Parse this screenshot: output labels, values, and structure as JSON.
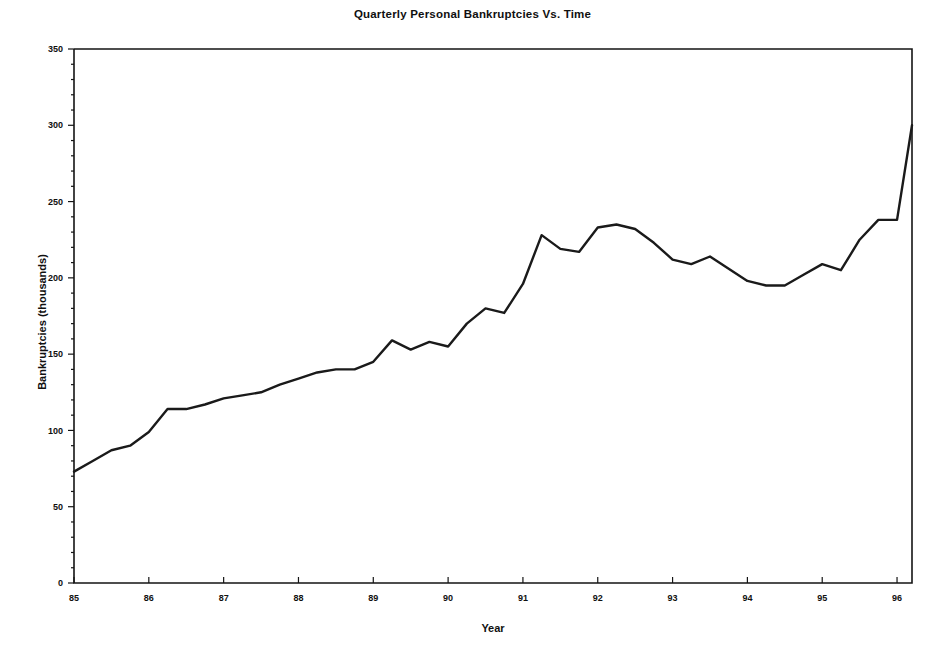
{
  "chart_data": {
    "type": "line",
    "title": "Quarterly Personal Bankruptcies Vs. Time",
    "xlabel": "Year",
    "ylabel": "Bankruptcies (thousands)",
    "xlim": [
      85,
      96.2
    ],
    "ylim": [
      0,
      350
    ],
    "grid": false,
    "legend": null,
    "xticks": [
      85,
      86,
      87,
      88,
      89,
      90,
      91,
      92,
      93,
      94,
      95,
      96
    ],
    "xtick_labels": [
      "85",
      "86",
      "87",
      "88",
      "89",
      "90",
      "91",
      "92",
      "93",
      "94",
      "95",
      "96"
    ],
    "yticks": [
      0,
      50,
      100,
      150,
      200,
      250,
      300,
      350
    ],
    "ytick_labels": [
      "0",
      "50",
      "100",
      "150",
      "200",
      "250",
      "300",
      "350"
    ],
    "line_color": "#1a1a1a",
    "series": [
      {
        "name": "Quarterly personal bankruptcies",
        "x": [
          85.0,
          85.25,
          85.5,
          85.75,
          86.0,
          86.25,
          86.5,
          86.75,
          87.0,
          87.25,
          87.5,
          87.75,
          88.0,
          88.25,
          88.5,
          88.75,
          89.0,
          89.25,
          89.5,
          89.75,
          90.0,
          90.25,
          90.5,
          90.75,
          91.0,
          91.25,
          91.5,
          91.75,
          92.0,
          92.25,
          92.5,
          92.75,
          93.0,
          93.25,
          93.5,
          93.75,
          94.0,
          94.25,
          94.5,
          94.75,
          95.0,
          95.25,
          95.5,
          95.75,
          96.0,
          96.2
        ],
        "values": [
          73,
          80,
          87,
          90,
          99,
          114,
          114,
          117,
          121,
          123,
          125,
          130,
          134,
          138,
          140,
          140,
          145,
          159,
          153,
          158,
          155,
          170,
          180,
          177,
          196,
          228,
          219,
          217,
          233,
          235,
          232,
          223,
          212,
          209,
          214,
          206,
          198,
          195,
          195,
          202,
          209,
          205,
          225,
          238,
          238,
          300
        ]
      }
    ]
  },
  "axes": {
    "title": "Quarterly Personal Bankruptcies Vs. Time",
    "xlabel": "Year",
    "ylabel": "Bankruptcies (thousands)"
  }
}
